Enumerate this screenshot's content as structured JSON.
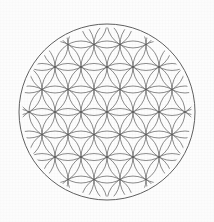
{
  "figure": {
    "title": "Flower of Life",
    "canvas": {
      "width": 214,
      "height": 222
    },
    "background_color": "#fdfdfd",
    "line_color": "#5a5a5a",
    "line_color_outer": "#4e4e4e",
    "line_width": 0.7,
    "line_width_outer": 0.9
  },
  "chart_data": {
    "type": "scatter",
    "title": "Flower of Life",
    "xlabel": "",
    "ylabel": "",
    "grid": false,
    "legend_position": "none",
    "geometry": {
      "center_x": 107,
      "center_y": 112,
      "outer_radius": 88,
      "cell_radius": 26,
      "lattice_rows": 9,
      "lattice_columns": 9,
      "row_height": 22.517,
      "clip_radius": 84.5,
      "circle_count": 61
    },
    "lattice_centers": [
      [
        107,
        112
      ],
      [
        81,
        112
      ],
      [
        133,
        112
      ],
      [
        55,
        112
      ],
      [
        159,
        112
      ],
      [
        29,
        112
      ],
      [
        185,
        112
      ],
      [
        94,
        89.48
      ],
      [
        120,
        89.48
      ],
      [
        68,
        89.48
      ],
      [
        146,
        89.48
      ],
      [
        42,
        89.48
      ],
      [
        172,
        89.48
      ],
      [
        94,
        134.52
      ],
      [
        120,
        134.52
      ],
      [
        68,
        134.52
      ],
      [
        146,
        134.52
      ],
      [
        42,
        134.52
      ],
      [
        172,
        134.52
      ],
      [
        107,
        66.97
      ],
      [
        81,
        66.97
      ],
      [
        133,
        66.97
      ],
      [
        55,
        66.97
      ],
      [
        159,
        66.97
      ],
      [
        29,
        66.97
      ],
      [
        185,
        66.97
      ],
      [
        107,
        157.03
      ],
      [
        81,
        157.03
      ],
      [
        133,
        157.03
      ],
      [
        55,
        157.03
      ],
      [
        159,
        157.03
      ],
      [
        29,
        157.03
      ],
      [
        185,
        157.03
      ],
      [
        94,
        44.45
      ],
      [
        120,
        44.45
      ],
      [
        68,
        44.45
      ],
      [
        146,
        44.45
      ],
      [
        42,
        44.45
      ],
      [
        172,
        44.45
      ],
      [
        94,
        179.55
      ],
      [
        120,
        179.55
      ],
      [
        68,
        179.55
      ],
      [
        146,
        179.55
      ],
      [
        42,
        179.55
      ],
      [
        172,
        179.55
      ],
      [
        107,
        21.93
      ],
      [
        81,
        21.93
      ],
      [
        133,
        21.93
      ],
      [
        55,
        21.93
      ],
      [
        159,
        21.93
      ],
      [
        107,
        202.07
      ],
      [
        81,
        202.07
      ],
      [
        133,
        202.07
      ],
      [
        55,
        202.07
      ],
      [
        159,
        202.07
      ]
    ]
  },
  "labels": {
    "figure_caption": "",
    "outer_ring_name": "bounding-circle",
    "pattern_name": "flower-of-life-grid"
  }
}
